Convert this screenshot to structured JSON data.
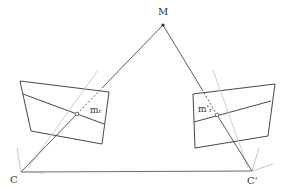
{
  "diagram": {
    "points": {
      "M": {
        "label": "M",
        "x": 163,
        "y": 25
      },
      "C": {
        "label": "C",
        "x": 21,
        "y": 172
      },
      "C_prime": {
        "label": "C'",
        "x": 252,
        "y": 171
      }
    },
    "image_points": {
      "left": {
        "label": "m",
        "subscript": "r",
        "x": 77,
        "y": 114
      },
      "right": {
        "label": "m'",
        "subscript": "r",
        "x": 217,
        "y": 115
      }
    },
    "colors": {
      "line": "#333333",
      "axis": "#bbbbbb"
    }
  }
}
